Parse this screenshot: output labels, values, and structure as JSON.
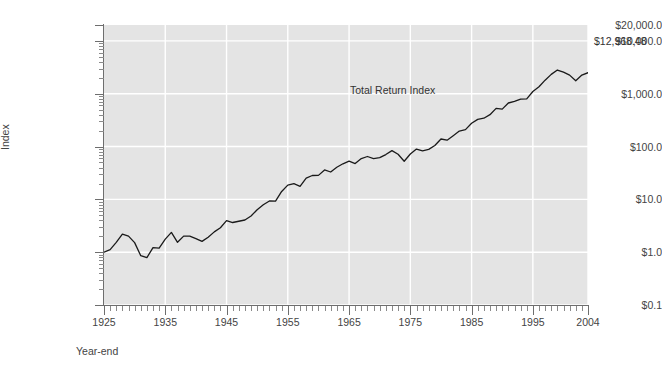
{
  "chart_data": {
    "type": "line",
    "title": "",
    "subtitle": "",
    "xlabel": "Year-end",
    "ylabel": "Index",
    "yscale": "log",
    "ylim": [
      0.1,
      20000
    ],
    "xlim": [
      1925,
      2004
    ],
    "grid": true,
    "legend_position": "inline-annotation",
    "background_color": "#e4e4e4",
    "gridline_color": "#ffffff",
    "line_color": "#1a1a1a",
    "axis_color": "#6e6e6e",
    "text_color": "#444444",
    "annotations": [
      {
        "name": "series-label",
        "text": "Total Return Index",
        "x": 1963,
        "y": 1100
      },
      {
        "name": "end-value",
        "text": "$12,968.48",
        "x": 2004,
        "y": 12968.48
      }
    ],
    "ytick_labels": [
      "$20,000.0",
      "$10,000.0",
      "$1,000.0",
      "$100.0",
      "$10.0",
      "$1.0",
      "$0.1"
    ],
    "ytick_values": [
      20000,
      10000,
      1000,
      100,
      10,
      1,
      0.1
    ],
    "xtick_labels": [
      "1925",
      "1935",
      "1945",
      "1955",
      "1965",
      "1975",
      "1985",
      "1995",
      "2004"
    ],
    "xtick_values": [
      1925,
      1935,
      1945,
      1955,
      1965,
      1975,
      1985,
      1995,
      2004
    ],
    "series": [
      {
        "name": "Total Return Index",
        "x": [
          1925,
          1926,
          1927,
          1928,
          1929,
          1930,
          1931,
          1932,
          1933,
          1934,
          1935,
          1936,
          1937,
          1938,
          1939,
          1940,
          1941,
          1942,
          1943,
          1944,
          1945,
          1946,
          1947,
          1948,
          1949,
          1950,
          1951,
          1952,
          1953,
          1954,
          1955,
          1956,
          1957,
          1958,
          1959,
          1960,
          1961,
          1962,
          1963,
          1964,
          1965,
          1966,
          1967,
          1968,
          1969,
          1970,
          1971,
          1972,
          1973,
          1974,
          1975,
          1976,
          1977,
          1978,
          1979,
          1980,
          1981,
          1982,
          1983,
          1984,
          1985,
          1986,
          1987,
          1988,
          1989,
          1990,
          1991,
          1992,
          1993,
          1994,
          1995,
          1996,
          1997,
          1998,
          1999,
          2000,
          2001,
          2002,
          2003,
          2004
        ],
        "values": [
          1.0,
          1.116,
          1.535,
          2.204,
          2.018,
          1.516,
          0.859,
          0.789,
          1.215,
          1.198,
          1.771,
          2.367,
          1.538,
          2.016,
          2.008,
          1.81,
          1.6,
          1.924,
          2.424,
          2.903,
          3.965,
          3.645,
          3.853,
          4.065,
          4.829,
          6.36,
          7.888,
          9.336,
          9.244,
          14.108,
          18.561,
          19.778,
          17.646,
          25.298,
          28.322,
          28.455,
          36.106,
          32.95,
          40.469,
          47.139,
          53.008,
          47.674,
          59.104,
          64.79,
          59.296,
          61.678,
          70.494,
          83.87,
          71.547,
          52.603,
          72.209,
          89.422,
          83.001,
          88.449,
          104.792,
          138.851,
          132.025,
          160.424,
          196.593,
          208.927,
          275.5,
          326.885,
          344.04,
          401.045,
          527.94,
          511.559,
          667.27,
          718.0,
          790.21,
          800.8,
          1101.2,
          1354.0,
          1805.7,
          2321.6,
          2810.3,
          2554.2,
          2250.9,
          1753.3,
          2256.1,
          2501.4
        ]
      }
    ],
    "note": "Values are a year-end growth-of-$1 total return index plotted on a base-10 logarithmic scale; final year-end value shown as $12,968.48 in the annotation."
  },
  "axis": {
    "y_title": "Index",
    "x_title": "Year-end"
  }
}
